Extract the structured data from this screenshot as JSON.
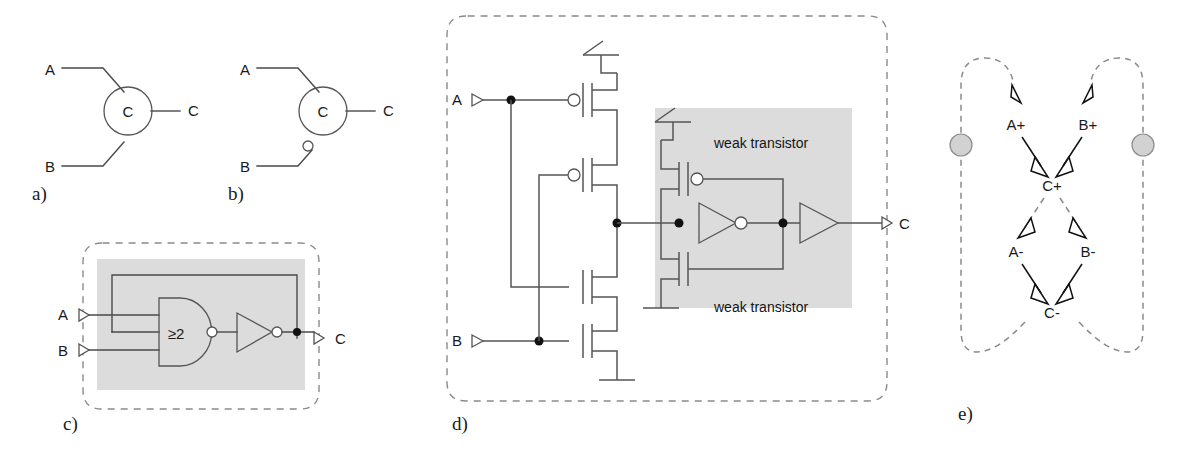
{
  "figure": {
    "panels": [
      {
        "id": "a",
        "label": "a)",
        "kind": "symbol",
        "symbol_text": "C",
        "inputs": [
          "A",
          "B"
        ],
        "outputs": [
          "C"
        ],
        "inverted_inputs": []
      },
      {
        "id": "b",
        "label": "b)",
        "kind": "symbol",
        "symbol_text": "C",
        "inputs": [
          "A",
          "B"
        ],
        "outputs": [
          "C"
        ],
        "inverted_inputs": [
          "B"
        ]
      },
      {
        "id": "c",
        "label": "c)",
        "kind": "gate-level",
        "inputs": [
          "A",
          "B"
        ],
        "outputs": [
          "C"
        ],
        "gate_label": "≥2",
        "elements": [
          "majority-gate",
          "inverter",
          "feedback-loop"
        ]
      },
      {
        "id": "d",
        "label": "d)",
        "kind": "transistor-level",
        "inputs": [
          "A",
          "B"
        ],
        "outputs": [
          "C"
        ],
        "annotations": [
          "weak transistor",
          "weak transistor"
        ],
        "weak_top_label": "weak transistor",
        "weak_bottom_label": "weak transistor",
        "elements": [
          "pmos-stack",
          "nmos-stack",
          "keeper-inverter",
          "output-buffer"
        ]
      },
      {
        "id": "e",
        "label": "e)",
        "kind": "signal-transition-graph",
        "transitions": [
          "A+",
          "B+",
          "C+",
          "A-",
          "B-",
          "C-"
        ],
        "tokens": 2,
        "nodes": [
          {
            "name": "A+",
            "x": 1016,
            "y": 124
          },
          {
            "name": "B+",
            "x": 1088,
            "y": 124
          },
          {
            "name": "C+",
            "x": 1052,
            "y": 185
          },
          {
            "name": "A-",
            "x": 1016,
            "y": 251
          },
          {
            "name": "B-",
            "x": 1088,
            "y": 251
          },
          {
            "name": "C-",
            "x": 1052,
            "y": 312
          }
        ]
      }
    ],
    "labels": {
      "sig_a": "A",
      "sig_b": "B",
      "sig_c": "C",
      "c_element": "C",
      "threshold_gate": "≥2",
      "weak_transistor": "weak transistor",
      "t_a_rise": "A+",
      "t_b_rise": "B+",
      "t_c_rise": "C+",
      "t_a_fall": "A-",
      "t_b_fall": "B-",
      "t_c_fall": "C-"
    },
    "colors": {
      "background": "#ffffff",
      "wire": "#4a4a4a",
      "dashed_boundary": "#8a8a8a",
      "gray_region": "#dcdcdc",
      "token": "#d2d2d2",
      "text": "#1a1a1a"
    }
  }
}
